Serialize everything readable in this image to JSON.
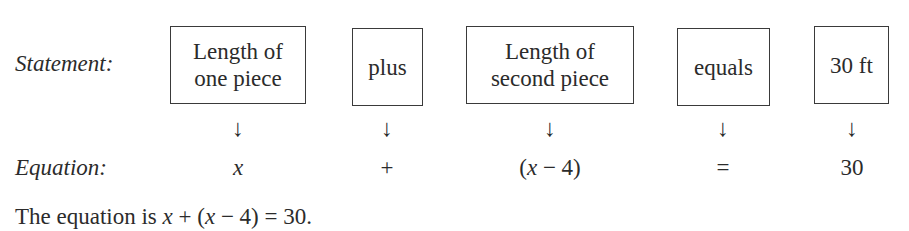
{
  "statement_row": {
    "label": "Statement:",
    "boxes": [
      {
        "line1": "Length of",
        "line2": "one piece"
      },
      {
        "line1": "plus"
      },
      {
        "line1": "Length of",
        "line2": "second piece"
      },
      {
        "line1": "equals"
      },
      {
        "line1": "30 ft"
      }
    ]
  },
  "arrows": [
    "↓",
    "↓",
    "↓",
    "↓",
    "↓"
  ],
  "equation_row": {
    "label": "Equation:",
    "terms": {
      "t0_var": "x",
      "t1": "+",
      "t2_open": "(",
      "t2_var": "x",
      "t2_rest": " − 4)",
      "t3": "=",
      "t4": "30"
    }
  },
  "conclusion": {
    "prefix": "The equation is ",
    "var1": "x",
    "mid1": " + (",
    "var2": "x",
    "mid2": " − 4) = 30."
  }
}
